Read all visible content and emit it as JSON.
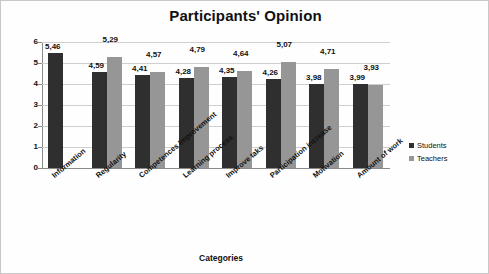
{
  "chart_data": {
    "type": "bar",
    "title": "Participants' Opinion",
    "xlabel": "Categories",
    "ylabel": "Mean",
    "ylim": [
      0,
      6
    ],
    "yticks": [
      0,
      1,
      2,
      3,
      4,
      5,
      6
    ],
    "grid": true,
    "legend_position": "right",
    "categories": [
      "Information",
      "Regularity",
      "Competences Improvement",
      "Learning process",
      "Improve taks",
      "Participation increase",
      "Motivation",
      "Amount of work"
    ],
    "series": [
      {
        "name": "Students",
        "color": "#2f2f2f",
        "values": [
          5.46,
          4.59,
          4.41,
          4.28,
          4.35,
          4.26,
          3.98,
          3.99
        ],
        "labels": [
          "5,46",
          "4,59",
          "4,41",
          "4,28",
          "4,35",
          "4,26",
          "3,98",
          "3,99"
        ]
      },
      {
        "name": "Teachers",
        "color": "#969696",
        "values": [
          null,
          5.29,
          4.57,
          4.79,
          4.64,
          5.07,
          4.71,
          3.93
        ],
        "labels": [
          "",
          "5,29",
          "4,57",
          "4,79",
          "4,64",
          "5,07",
          "4,71",
          "3,93"
        ]
      }
    ]
  },
  "legend": {
    "items": [
      {
        "label": "Students",
        "color": "#2f2f2f"
      },
      {
        "label": "Teachers",
        "color": "#969696"
      }
    ]
  }
}
